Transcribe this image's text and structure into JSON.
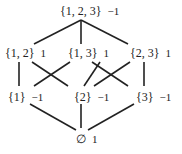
{
  "nodes": [
    {
      "id": "n123",
      "set": "{1, 2, 3}",
      "value": "−1",
      "x": 60,
      "y": 4
    },
    {
      "id": "n12",
      "set": "{1, 2}",
      "value": "1",
      "x": 5,
      "y": 46
    },
    {
      "id": "n13",
      "set": "{1, 3}",
      "value": "1",
      "x": 68,
      "y": 46
    },
    {
      "id": "n23",
      "set": "{2, 3}",
      "value": "1",
      "x": 130,
      "y": 46
    },
    {
      "id": "n1",
      "set": "{1}",
      "value": "−1",
      "x": 8,
      "y": 90
    },
    {
      "id": "n2",
      "set": "{2}",
      "value": "−1",
      "x": 74,
      "y": 90
    },
    {
      "id": "n3",
      "set": "{3}",
      "value": "−1",
      "x": 136,
      "y": 90
    },
    {
      "id": "n0",
      "set": "∅",
      "value": "1",
      "x": 76,
      "y": 132
    }
  ],
  "edges": [
    [
      81,
      20,
      34,
      44
    ],
    [
      81,
      20,
      81,
      44
    ],
    [
      81,
      20,
      128,
      44
    ],
    [
      19,
      62,
      19,
      86
    ],
    [
      32,
      62,
      68,
      86
    ],
    [
      70,
      62,
      34,
      86
    ],
    [
      92,
      62,
      128,
      86
    ],
    [
      100,
      62,
      84,
      86
    ],
    [
      130,
      62,
      94,
      86
    ],
    [
      144,
      62,
      144,
      86
    ],
    [
      30,
      104,
      76,
      130
    ],
    [
      81,
      104,
      81,
      128
    ],
    [
      134,
      104,
      88,
      130
    ]
  ],
  "colors": {
    "line": "#222222",
    "text": "#222222",
    "background": "#ffffff"
  }
}
